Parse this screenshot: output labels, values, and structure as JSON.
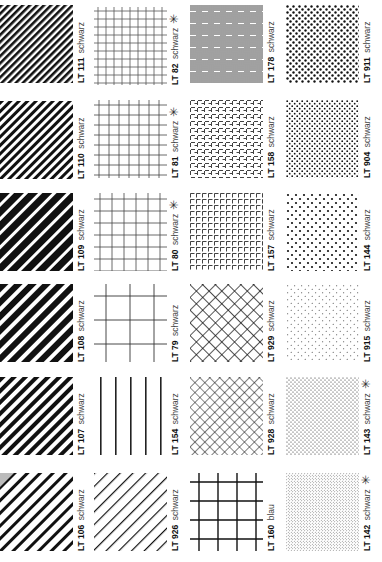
{
  "page": {
    "orientation": "rotated-90",
    "columns": 4,
    "rows": 6
  },
  "swatches": [
    [
      {
        "code": "LT 111",
        "color": "schwarz",
        "starred": "",
        "pattern": "diagonal-lines-fine"
      },
      {
        "code": "LT 82",
        "color": "schwarz",
        "starred": "✳",
        "pattern": "grid-fine"
      },
      {
        "code": "LT 178",
        "color": "schwarz",
        "starred": "",
        "pattern": "basketweave"
      },
      {
        "code": "LT 911",
        "color": "schwarz",
        "starred": "",
        "pattern": "dots-large"
      }
    ],
    [
      {
        "code": "LT 110",
        "color": "schwarz",
        "starred": "",
        "pattern": "diagonal-lines-medium"
      },
      {
        "code": "LT 81",
        "color": "schwarz",
        "starred": "✳",
        "pattern": "grid-medium"
      },
      {
        "code": "LT 158",
        "color": "schwarz",
        "starred": "",
        "pattern": "dashed-grid-offset"
      },
      {
        "code": "LT 904",
        "color": "schwarz",
        "starred": "",
        "pattern": "dots-medium"
      }
    ],
    [
      {
        "code": "LT 109",
        "color": "schwarz",
        "starred": "",
        "pattern": "diagonal-lines-bold"
      },
      {
        "code": "LT 80",
        "color": "schwarz",
        "starred": "✳",
        "pattern": "grid-coarse"
      },
      {
        "code": "LT 157",
        "color": "schwarz",
        "starred": "",
        "pattern": "dashed-grid"
      },
      {
        "code": "LT 144",
        "color": "schwarz",
        "starred": "",
        "pattern": "dots-sparse-large"
      }
    ],
    [
      {
        "code": "LT 108",
        "color": "schwarz",
        "starred": "",
        "pattern": "diagonal-lines-heavy"
      },
      {
        "code": "LT 79",
        "color": "schwarz",
        "starred": "",
        "pattern": "grid-very-coarse"
      },
      {
        "code": "LT 929",
        "color": "schwarz",
        "starred": "",
        "pattern": "diamond-crosshatch-coarse"
      },
      {
        "code": "LT 915",
        "color": "schwarz",
        "starred": "",
        "pattern": "dots-sparse-small"
      }
    ],
    [
      {
        "code": "LT 107",
        "color": "schwarz",
        "starred": "",
        "pattern": "diagonal-lines-heavy-2"
      },
      {
        "code": "LT 154",
        "color": "schwarz",
        "starred": "",
        "pattern": "vertical-lines"
      },
      {
        "code": "LT 928",
        "color": "schwarz",
        "starred": "",
        "pattern": "diamond-crosshatch-fine"
      },
      {
        "code": "LT 143",
        "color": "schwarz",
        "starred": "✳",
        "pattern": "dots-small"
      }
    ],
    [
      {
        "code": "LT 106",
        "color": "schwarz",
        "starred": "",
        "pattern": "diagonal-lines-wide"
      },
      {
        "code": "LT 926",
        "color": "schwarz",
        "starred": "",
        "pattern": "diagonal-thin-lines"
      },
      {
        "code": "LT 160",
        "color": "blau",
        "starred": "",
        "pattern": "grid-bold"
      },
      {
        "code": "LT 142",
        "color": "schwarz",
        "starred": "✳",
        "pattern": "dots-tiny"
      }
    ]
  ],
  "colors": {
    "ink": "#111111",
    "label_text": "#222222",
    "corner_gray": "#bbbbbb",
    "paper": "#ffffff"
  }
}
